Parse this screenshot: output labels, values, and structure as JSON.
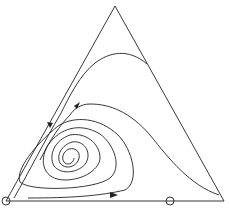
{
  "diagram": {
    "type": "ternary-phase-portrait",
    "stroke_color": "#222222",
    "background": "#ffffff",
    "triangle": {
      "top": [
        115,
        6
      ],
      "left": [
        6,
        201
      ],
      "right": [
        224,
        201
      ]
    },
    "fixed_points": [
      {
        "name": "left-vertex-equilibrium",
        "cx": 6,
        "cy": 201,
        "r": 4
      },
      {
        "name": "edge-equilibrium",
        "cx": 170,
        "cy": 201,
        "r": 4
      }
    ],
    "spiral_center": [
      56,
      160
    ]
  }
}
